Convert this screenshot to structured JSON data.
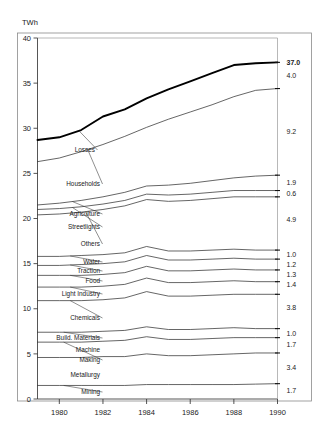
{
  "axis": {
    "unit_label": "TWh",
    "y_ticks": [
      "40",
      "35",
      "30",
      "25",
      "20",
      "15",
      "10",
      "5",
      "0"
    ],
    "y_values": [
      40,
      35,
      30,
      25,
      20,
      15,
      10,
      5,
      0
    ],
    "x_ticks": [
      "1980",
      "1982",
      "1984",
      "1986",
      "1988",
      "1990"
    ],
    "x_values": [
      1980,
      1982,
      1984,
      1986,
      1988,
      1990
    ]
  },
  "chart_data": {
    "type": "line",
    "title": "",
    "subtitle": "",
    "xlabel": "",
    "ylabel": "TWh",
    "xlim": [
      1979,
      1990
    ],
    "ylim": [
      0,
      40
    ],
    "grid": false,
    "legend": "inline-left-labels",
    "note": "Cumulative (stacked) line chart: each curve is the running total of sectors below it. Right-hand numbers are the 1990 band thickness for each sector; 37.0 is the grand total.",
    "x": [
      1979,
      1980,
      1981,
      1982,
      1983,
      1984,
      1985,
      1986,
      1987,
      1988,
      1989,
      1990
    ],
    "series": [
      {
        "name": "Mining",
        "right_value": "1.7",
        "label": "Mining",
        "values": [
          1.5,
          1.5,
          1.5,
          1.5,
          1.5,
          1.6,
          1.6,
          1.6,
          1.6,
          1.6,
          1.65,
          1.7
        ]
      },
      {
        "name": "Metallurgy",
        "right_value": "3.4",
        "label": "Metallurgy",
        "values": [
          4.6,
          4.6,
          4.6,
          4.7,
          4.7,
          5.0,
          4.8,
          4.8,
          4.9,
          5.0,
          5.1,
          5.1
        ]
      },
      {
        "name": "Machine Making",
        "right_value": "1.7",
        "label": "Machine\nMaking",
        "values": [
          6.3,
          6.3,
          6.3,
          6.4,
          6.5,
          6.9,
          6.6,
          6.6,
          6.7,
          6.8,
          6.8,
          6.8
        ]
      },
      {
        "name": "Build. Materials",
        "right_value": "1.0",
        "label": "Build. Materials",
        "values": [
          7.4,
          7.4,
          7.4,
          7.5,
          7.6,
          8.0,
          7.7,
          7.7,
          7.8,
          7.9,
          7.8,
          7.8
        ]
      },
      {
        "name": "Chemicals",
        "right_value": "3.8",
        "label": "Chemicals",
        "values": [
          10.9,
          10.9,
          10.9,
          11.0,
          11.2,
          11.9,
          11.4,
          11.4,
          11.5,
          11.6,
          11.6,
          11.6
        ]
      },
      {
        "name": "Light Industry",
        "right_value": "1.4",
        "label": "Light Industry",
        "values": [
          12.4,
          12.4,
          12.4,
          12.5,
          12.7,
          13.4,
          12.9,
          12.9,
          13.0,
          13.1,
          13.0,
          13.0
        ]
      },
      {
        "name": "Food",
        "right_value": "1.3",
        "label": "Food",
        "values": [
          13.7,
          13.7,
          13.7,
          13.8,
          14.0,
          14.7,
          14.2,
          14.2,
          14.3,
          14.4,
          14.3,
          14.3
        ]
      },
      {
        "name": "Traction",
        "right_value": "1.2",
        "label": "Traction",
        "values": [
          14.8,
          14.8,
          14.9,
          15.0,
          15.2,
          15.9,
          15.4,
          15.4,
          15.5,
          15.6,
          15.5,
          15.5
        ]
      },
      {
        "name": "Water",
        "right_value": "1.0",
        "label": "Water",
        "values": [
          15.8,
          15.8,
          15.9,
          16.0,
          16.2,
          16.9,
          16.4,
          16.4,
          16.5,
          16.6,
          16.5,
          16.5
        ]
      },
      {
        "name": "Others",
        "right_value": "4.9",
        "label": "Others",
        "values": [
          20.4,
          20.5,
          20.7,
          21.0,
          21.4,
          22.1,
          21.9,
          22.0,
          22.2,
          22.4,
          22.4,
          22.4
        ]
      },
      {
        "name": "Streetlights",
        "right_value": "0.6",
        "label": "Streetlights",
        "values": [
          21.0,
          21.1,
          21.3,
          21.6,
          22.0,
          22.7,
          22.6,
          22.7,
          22.9,
          23.1,
          23.1,
          23.1
        ]
      },
      {
        "name": "Agriculture",
        "right_value": "1.9",
        "label": "Agriculture",
        "values": [
          21.5,
          21.7,
          22.0,
          22.4,
          22.9,
          23.6,
          23.7,
          23.9,
          24.2,
          24.5,
          24.7,
          24.8
        ]
      },
      {
        "name": "Households",
        "right_value": "9.2",
        "label": "Households",
        "values": [
          26.3,
          26.7,
          27.4,
          28.2,
          29.1,
          30.1,
          31.0,
          31.8,
          32.6,
          33.5,
          34.2,
          34.4
        ]
      },
      {
        "name": "Losses",
        "right_value": "4.0",
        "label": "Losses",
        "values": [
          28.7,
          29.0,
          29.8,
          31.3,
          32.1,
          33.3,
          34.3,
          35.2,
          36.1,
          37.0,
          37.2,
          37.3
        ]
      }
    ],
    "total": {
      "label": "37.0",
      "value": 37.0,
      "emphasis": "bold"
    },
    "right_values": [
      "37.0",
      "4.0",
      "9.2",
      "1.9",
      "0.6",
      "4.9",
      "1.0",
      "1.2",
      "1.3",
      "1.4",
      "3.8",
      "1.0",
      "1.7",
      "3.4",
      "1.7"
    ]
  }
}
